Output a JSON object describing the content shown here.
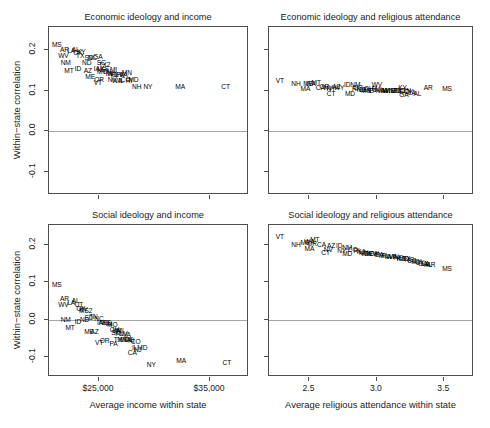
{
  "figure": {
    "width": 490,
    "height": 428,
    "background": "#ffffff",
    "ink": "#000000",
    "axis_color": "#4d4d4d",
    "zeroline_color": "#a6a6a6"
  },
  "axes": {
    "y_title": "Within−state correlation",
    "y_ticks": [
      "-0.1",
      "0.0",
      "0.1",
      "0.2"
    ],
    "x_title_income": "Average income within state",
    "x_ticks_income": [
      "$25,000",
      "$35,000"
    ],
    "x_title_attendance": "Average religious attendance within state",
    "x_ticks_attendance": [
      "2.5",
      "3.0",
      "3.5"
    ]
  },
  "chart_data": [
    {
      "type": "scatter",
      "panel": "top-left",
      "title": "Economic ideology and income",
      "xlabel": "Average income within state",
      "ylabel": "Within−state correlation",
      "xlim": [
        20500,
        38500
      ],
      "ylim": [
        -0.155,
        0.255
      ],
      "xticks": [
        25000,
        35000
      ],
      "yticks": [
        -0.1,
        0.0,
        0.1,
        0.2
      ],
      "grid": false,
      "zeroline": 0.0,
      "point_labels": true,
      "points": [
        {
          "label": "MS",
          "x": 21200,
          "y": 0.212
        },
        {
          "label": "AR",
          "x": 21900,
          "y": 0.198
        },
        {
          "label": "LA",
          "x": 22500,
          "y": 0.196
        },
        {
          "label": "AL",
          "x": 22900,
          "y": 0.2
        },
        {
          "label": "WV",
          "x": 21800,
          "y": 0.184
        },
        {
          "label": "OK",
          "x": 23100,
          "y": 0.192
        },
        {
          "label": "KY",
          "x": 23400,
          "y": 0.194
        },
        {
          "label": "TX",
          "x": 23300,
          "y": 0.184
        },
        {
          "label": "SD",
          "x": 24100,
          "y": 0.18
        },
        {
          "label": "NC",
          "x": 24400,
          "y": 0.179
        },
        {
          "label": "GA",
          "x": 24900,
          "y": 0.182
        },
        {
          "label": "NM",
          "x": 22000,
          "y": 0.166
        },
        {
          "label": "ND",
          "x": 23900,
          "y": 0.166
        },
        {
          "label": "SC",
          "x": 25200,
          "y": 0.168
        },
        {
          "label": "TX2",
          "x": 25500,
          "y": 0.162
        },
        {
          "label": "MT",
          "x": 22300,
          "y": 0.148
        },
        {
          "label": "ID",
          "x": 23100,
          "y": 0.152
        },
        {
          "label": "AZ",
          "x": 24000,
          "y": 0.148
        },
        {
          "label": "IA",
          "x": 24800,
          "y": 0.152
        },
        {
          "label": "NE",
          "x": 25200,
          "y": 0.15
        },
        {
          "label": "KS",
          "x": 25500,
          "y": 0.152
        },
        {
          "label": "MO",
          "x": 25300,
          "y": 0.146
        },
        {
          "label": "TN",
          "x": 25700,
          "y": 0.144
        },
        {
          "label": "MI",
          "x": 26300,
          "y": 0.15
        },
        {
          "label": "ME",
          "x": 24200,
          "y": 0.132
        },
        {
          "label": "OR",
          "x": 25000,
          "y": 0.126
        },
        {
          "label": "VT",
          "x": 24900,
          "y": 0.118
        },
        {
          "label": "IN",
          "x": 25900,
          "y": 0.14
        },
        {
          "label": "WI",
          "x": 26100,
          "y": 0.14
        },
        {
          "label": "FL",
          "x": 26400,
          "y": 0.138
        },
        {
          "label": "OH",
          "x": 26600,
          "y": 0.138
        },
        {
          "label": "PA",
          "x": 26900,
          "y": 0.138
        },
        {
          "label": "VA",
          "x": 27200,
          "y": 0.138
        },
        {
          "label": "MN",
          "x": 27500,
          "y": 0.142
        },
        {
          "label": "NV",
          "x": 26200,
          "y": 0.126
        },
        {
          "label": "WA",
          "x": 26600,
          "y": 0.124
        },
        {
          "label": "IL",
          "x": 27000,
          "y": 0.124
        },
        {
          "label": "CO",
          "x": 27400,
          "y": 0.126
        },
        {
          "label": "RI",
          "x": 27700,
          "y": 0.124
        },
        {
          "label": "MD",
          "x": 28100,
          "y": 0.126
        },
        {
          "label": "NH",
          "x": 28400,
          "y": 0.108
        },
        {
          "label": "NY",
          "x": 29400,
          "y": 0.108
        },
        {
          "label": "MA",
          "x": 32300,
          "y": 0.108
        },
        {
          "label": "CT",
          "x": 36400,
          "y": 0.108
        }
      ]
    },
    {
      "type": "scatter",
      "panel": "top-right",
      "title": "Economic ideology and religious attendance",
      "xlabel": "Average religious attendance within state",
      "ylabel": "Within−state correlation",
      "xlim": [
        2.2,
        3.72
      ],
      "ylim": [
        -0.155,
        0.255
      ],
      "xticks": [
        2.5,
        3.0,
        3.5
      ],
      "yticks": [
        -0.1,
        0.0,
        0.1,
        0.2
      ],
      "grid": false,
      "zeroline": 0.0,
      "point_labels": true,
      "points": [
        {
          "label": "VT",
          "x": 2.28,
          "y": 0.122
        },
        {
          "label": "NH",
          "x": 2.4,
          "y": 0.116
        },
        {
          "label": "MA",
          "x": 2.47,
          "y": 0.104
        },
        {
          "label": "ME",
          "x": 2.49,
          "y": 0.116
        },
        {
          "label": "WA",
          "x": 2.51,
          "y": 0.116
        },
        {
          "label": "MT",
          "x": 2.55,
          "y": 0.118
        },
        {
          "label": "CA",
          "x": 2.58,
          "y": 0.106
        },
        {
          "label": "OR",
          "x": 2.61,
          "y": 0.108
        },
        {
          "label": "NV",
          "x": 2.64,
          "y": 0.106
        },
        {
          "label": "NY",
          "x": 2.66,
          "y": 0.104
        },
        {
          "label": "CT",
          "x": 2.66,
          "y": 0.092
        },
        {
          "label": "AZ",
          "x": 2.7,
          "y": 0.108
        },
        {
          "label": "WY",
          "x": 2.72,
          "y": 0.106
        },
        {
          "label": "ID",
          "x": 2.78,
          "y": 0.114
        },
        {
          "label": "NM",
          "x": 2.84,
          "y": 0.114
        },
        {
          "label": "MD",
          "x": 2.8,
          "y": 0.092
        },
        {
          "label": "RI",
          "x": 2.84,
          "y": 0.104
        },
        {
          "label": "CO",
          "x": 2.86,
          "y": 0.106
        },
        {
          "label": "NJ",
          "x": 2.88,
          "y": 0.102
        },
        {
          "label": "DE",
          "x": 2.9,
          "y": 0.102
        },
        {
          "label": "MN",
          "x": 2.92,
          "y": 0.098
        },
        {
          "label": "OH",
          "x": 2.94,
          "y": 0.104
        },
        {
          "label": "IL",
          "x": 2.95,
          "y": 0.1
        },
        {
          "label": "PA",
          "x": 2.97,
          "y": 0.1
        },
        {
          "label": "FL",
          "x": 2.99,
          "y": 0.104
        },
        {
          "label": "WV",
          "x": 3.0,
          "y": 0.114
        },
        {
          "label": "MI",
          "x": 3.01,
          "y": 0.102
        },
        {
          "label": "VA",
          "x": 3.03,
          "y": 0.1
        },
        {
          "label": "IN",
          "x": 3.05,
          "y": 0.1
        },
        {
          "label": "IA",
          "x": 3.06,
          "y": 0.1
        },
        {
          "label": "WI",
          "x": 3.07,
          "y": 0.098
        },
        {
          "label": "KS",
          "x": 3.1,
          "y": 0.1
        },
        {
          "label": "NE",
          "x": 3.12,
          "y": 0.1
        },
        {
          "label": "MO",
          "x": 3.14,
          "y": 0.1
        },
        {
          "label": "TX",
          "x": 3.15,
          "y": 0.1
        },
        {
          "label": "NC",
          "x": 3.17,
          "y": 0.098
        },
        {
          "label": "KY",
          "x": 3.19,
          "y": 0.106
        },
        {
          "label": "SC",
          "x": 3.2,
          "y": 0.096
        },
        {
          "label": "TN",
          "x": 3.22,
          "y": 0.098
        },
        {
          "label": "OK",
          "x": 3.24,
          "y": 0.096
        },
        {
          "label": "GA",
          "x": 3.2,
          "y": 0.088
        },
        {
          "label": "LA",
          "x": 3.26,
          "y": 0.094
        },
        {
          "label": "AL",
          "x": 3.3,
          "y": 0.092
        },
        {
          "label": "AR",
          "x": 3.38,
          "y": 0.106
        },
        {
          "label": "MS",
          "x": 3.52,
          "y": 0.104
        }
      ]
    },
    {
      "type": "scatter",
      "panel": "bottom-left",
      "title": "Social ideology and income",
      "xlabel": "Average income within state",
      "ylabel": "Within−state correlation",
      "xlim": [
        20500,
        38500
      ],
      "ylim": [
        -0.155,
        0.255
      ],
      "xticks": [
        25000,
        35000
      ],
      "yticks": [
        -0.1,
        0.0,
        0.1,
        0.2
      ],
      "grid": false,
      "zeroline": 0.0,
      "point_labels": true,
      "points": [
        {
          "label": "MS",
          "x": 21200,
          "y": 0.092
        },
        {
          "label": "AR",
          "x": 21900,
          "y": 0.056
        },
        {
          "label": "LA",
          "x": 22500,
          "y": 0.044
        },
        {
          "label": "AL",
          "x": 22900,
          "y": 0.05
        },
        {
          "label": "WV",
          "x": 21800,
          "y": 0.04
        },
        {
          "label": "UT",
          "x": 23200,
          "y": 0.04
        },
        {
          "label": "OK",
          "x": 23400,
          "y": 0.028
        },
        {
          "label": "KY",
          "x": 23600,
          "y": 0.026
        },
        {
          "label": "MS2",
          "x": 23800,
          "y": 0.022
        },
        {
          "label": "NM",
          "x": 22000,
          "y": 0.0
        },
        {
          "label": "ID",
          "x": 23100,
          "y": -0.006
        },
        {
          "label": "ND",
          "x": 23700,
          "y": 0.0
        },
        {
          "label": "SD",
          "x": 24100,
          "y": 0.004
        },
        {
          "label": "TN",
          "x": 24500,
          "y": 0.006
        },
        {
          "label": "NC",
          "x": 25000,
          "y": 0.002
        },
        {
          "label": "MT",
          "x": 22400,
          "y": -0.022
        },
        {
          "label": "ME",
          "x": 24100,
          "y": -0.034
        },
        {
          "label": "IA",
          "x": 25100,
          "y": -0.008
        },
        {
          "label": "NE",
          "x": 25400,
          "y": -0.008
        },
        {
          "label": "KS",
          "x": 25700,
          "y": -0.01
        },
        {
          "label": "IN",
          "x": 25900,
          "y": -0.012
        },
        {
          "label": "MO",
          "x": 26200,
          "y": -0.014
        },
        {
          "label": "AZ",
          "x": 24600,
          "y": -0.034
        },
        {
          "label": "OH",
          "x": 26400,
          "y": -0.028
        },
        {
          "label": "WI",
          "x": 26600,
          "y": -0.03
        },
        {
          "label": "MI",
          "x": 26900,
          "y": -0.032
        },
        {
          "label": "SC",
          "x": 26500,
          "y": -0.036
        },
        {
          "label": "FL",
          "x": 26800,
          "y": -0.038
        },
        {
          "label": "NV",
          "x": 27200,
          "y": -0.04
        },
        {
          "label": "VA",
          "x": 27500,
          "y": -0.042
        },
        {
          "label": "VT",
          "x": 25000,
          "y": -0.062
        },
        {
          "label": "OR",
          "x": 25500,
          "y": -0.058
        },
        {
          "label": "PA",
          "x": 26300,
          "y": -0.066
        },
        {
          "label": "TX",
          "x": 26700,
          "y": -0.054
        },
        {
          "label": "MN",
          "x": 27100,
          "y": -0.054
        },
        {
          "label": "WA",
          "x": 27400,
          "y": -0.056
        },
        {
          "label": "DE",
          "x": 27700,
          "y": -0.056
        },
        {
          "label": "RI",
          "x": 27900,
          "y": -0.058
        },
        {
          "label": "CO",
          "x": 28300,
          "y": -0.06
        },
        {
          "label": "IL",
          "x": 28200,
          "y": -0.078
        },
        {
          "label": "CA",
          "x": 28000,
          "y": -0.09
        },
        {
          "label": "NJ",
          "x": 28500,
          "y": -0.082
        },
        {
          "label": "MD",
          "x": 28900,
          "y": -0.078
        },
        {
          "label": "NY",
          "x": 29700,
          "y": -0.122
        },
        {
          "label": "MA",
          "x": 32400,
          "y": -0.112
        },
        {
          "label": "CT",
          "x": 36500,
          "y": -0.118
        }
      ]
    },
    {
      "type": "scatter",
      "panel": "bottom-right",
      "title": "Social ideology and religious attendance",
      "xlabel": "Average religious attendance within state",
      "ylabel": "Within−state correlation",
      "xlim": [
        2.2,
        3.72
      ],
      "ylim": [
        -0.155,
        0.255
      ],
      "xticks": [
        2.5,
        3.0,
        3.5
      ],
      "yticks": [
        -0.1,
        0.0,
        0.1,
        0.2
      ],
      "grid": false,
      "zeroline": 0.0,
      "point_labels": true,
      "points": [
        {
          "label": "VT",
          "x": 2.28,
          "y": 0.222
        },
        {
          "label": "NH",
          "x": 2.4,
          "y": 0.202
        },
        {
          "label": "ME",
          "x": 2.47,
          "y": 0.206
        },
        {
          "label": "WA",
          "x": 2.5,
          "y": 0.208
        },
        {
          "label": "MT",
          "x": 2.54,
          "y": 0.214
        },
        {
          "label": "OR",
          "x": 2.52,
          "y": 0.204
        },
        {
          "label": "MA",
          "x": 2.5,
          "y": 0.19
        },
        {
          "label": "CA",
          "x": 2.59,
          "y": 0.2
        },
        {
          "label": "AZ",
          "x": 2.66,
          "y": 0.198
        },
        {
          "label": "NV",
          "x": 2.64,
          "y": 0.188
        },
        {
          "label": "CT",
          "x": 2.62,
          "y": 0.18
        },
        {
          "label": "ID",
          "x": 2.72,
          "y": 0.198
        },
        {
          "label": "NM",
          "x": 2.78,
          "y": 0.194
        },
        {
          "label": "NY",
          "x": 2.74,
          "y": 0.186
        },
        {
          "label": "MD",
          "x": 2.78,
          "y": 0.178
        },
        {
          "label": "CO",
          "x": 2.82,
          "y": 0.188
        },
        {
          "label": "RI",
          "x": 2.85,
          "y": 0.184
        },
        {
          "label": "NJ",
          "x": 2.88,
          "y": 0.182
        },
        {
          "label": "MN",
          "x": 2.9,
          "y": 0.18
        },
        {
          "label": "WY",
          "x": 2.92,
          "y": 0.178
        },
        {
          "label": "DE",
          "x": 2.94,
          "y": 0.178
        },
        {
          "label": "WV",
          "x": 2.96,
          "y": 0.176
        },
        {
          "label": "OH",
          "x": 2.98,
          "y": 0.176
        },
        {
          "label": "IL",
          "x": 3.0,
          "y": 0.174
        },
        {
          "label": "PA",
          "x": 3.02,
          "y": 0.174
        },
        {
          "label": "MI",
          "x": 3.04,
          "y": 0.172
        },
        {
          "label": "FL",
          "x": 3.06,
          "y": 0.172
        },
        {
          "label": "IA",
          "x": 3.08,
          "y": 0.17
        },
        {
          "label": "WI",
          "x": 3.1,
          "y": 0.17
        },
        {
          "label": "VA",
          "x": 3.12,
          "y": 0.168
        },
        {
          "label": "IN",
          "x": 3.14,
          "y": 0.168
        },
        {
          "label": "NE",
          "x": 3.16,
          "y": 0.166
        },
        {
          "label": "KS",
          "x": 3.18,
          "y": 0.164
        },
        {
          "label": "MO",
          "x": 3.2,
          "y": 0.164
        },
        {
          "label": "TX",
          "x": 3.22,
          "y": 0.162
        },
        {
          "label": "NC",
          "x": 3.24,
          "y": 0.16
        },
        {
          "label": "SC",
          "x": 3.26,
          "y": 0.158
        },
        {
          "label": "TN",
          "x": 3.28,
          "y": 0.156
        },
        {
          "label": "KY",
          "x": 3.3,
          "y": 0.154
        },
        {
          "label": "OK",
          "x": 3.32,
          "y": 0.152
        },
        {
          "label": "GA",
          "x": 3.34,
          "y": 0.15
        },
        {
          "label": "LA",
          "x": 3.36,
          "y": 0.15
        },
        {
          "label": "AL",
          "x": 3.38,
          "y": 0.148
        },
        {
          "label": "AR",
          "x": 3.4,
          "y": 0.148
        },
        {
          "label": "MS",
          "x": 3.52,
          "y": 0.136
        }
      ]
    }
  ]
}
